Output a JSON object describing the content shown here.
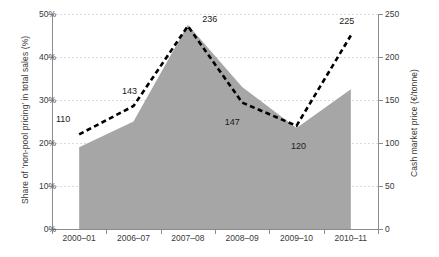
{
  "chart_data": {
    "type": "area",
    "title": "",
    "categories": [
      "2000–01",
      "2006–07",
      "2007–08",
      "2008–09",
      "2009–10",
      "2010–11"
    ],
    "series": [
      {
        "name": "Share of 'non-pool pricing' in total sales (%)",
        "type": "area",
        "axis": "left",
        "values": [
          19,
          25,
          47.5,
          33,
          23.5,
          32.5
        ],
        "color": "#a6a6a6"
      },
      {
        "name": "Cash market price (€/tonne)",
        "type": "line",
        "axis": "right",
        "style": "dashed",
        "values": [
          110,
          143,
          236,
          147,
          120,
          225
        ],
        "color": "#000000",
        "data_labels": [
          "110",
          "143",
          "236",
          "147",
          "120",
          "225"
        ]
      }
    ],
    "xlabel": "",
    "ylabel": "Share of 'non-pool pricing' in total sales (%)",
    "y2label": "Cash market price (€/tonne)",
    "ylim": [
      0,
      50
    ],
    "y2lim": [
      0,
      250
    ],
    "yticks": [
      "0%",
      "10%",
      "20%",
      "30%",
      "40%",
      "50%"
    ],
    "ytick_values": [
      0,
      10,
      20,
      30,
      40,
      50
    ],
    "y2ticks": [
      "0",
      "50",
      "100",
      "150",
      "200",
      "250"
    ],
    "y2tick_values": [
      0,
      50,
      100,
      150,
      200,
      250
    ],
    "grid": true,
    "gridline_style": "dotted",
    "legend": "none"
  },
  "axes": {
    "left_title": "Share of ‘non-pool pricing’ in total sales (%)",
    "right_title": "Cash market price (€/tonne)"
  }
}
